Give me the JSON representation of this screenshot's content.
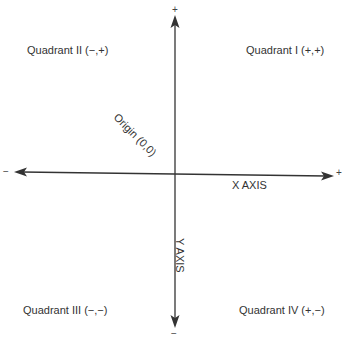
{
  "diagram": {
    "type": "cartesian-quadrants",
    "quadrants": [
      {
        "id": "I",
        "label": "Quadrant I (+,+)"
      },
      {
        "id": "II",
        "label": "Quadrant II (−,+)"
      },
      {
        "id": "III",
        "label": "Quadrant III (−,−)"
      },
      {
        "id": "IV",
        "label": "Quadrant IV (+,−)"
      }
    ],
    "axes": {
      "x_label": "X AXIS",
      "y_label": "Y AXIS",
      "x_positive": "+",
      "x_negative": "−",
      "y_positive": "+",
      "y_negative": "−"
    },
    "origin_label": "Origin (0,0)",
    "colors": {
      "axis": "#333333",
      "text": "#333333",
      "background": "#ffffff"
    }
  }
}
